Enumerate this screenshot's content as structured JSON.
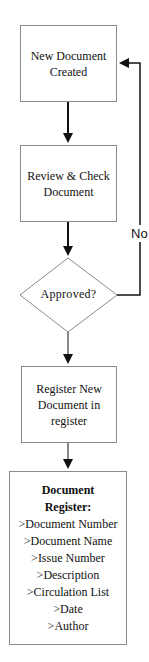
{
  "nodes": {
    "created": {
      "lines": [
        "New Document",
        "Created"
      ]
    },
    "review": {
      "lines": [
        "Review & Check",
        "Document"
      ]
    },
    "decision": {
      "label": "Approved?"
    },
    "register_new": {
      "lines": [
        "Register New",
        "Document in",
        "register"
      ]
    },
    "register": {
      "title_lines": [
        "Document",
        "Register:"
      ],
      "fields": [
        ">Document Number",
        ">Document Name",
        ">Issue Number",
        ">Description",
        ">Circulation List",
        ">Date",
        ">Author"
      ]
    }
  },
  "edges": {
    "no_label": "No"
  }
}
